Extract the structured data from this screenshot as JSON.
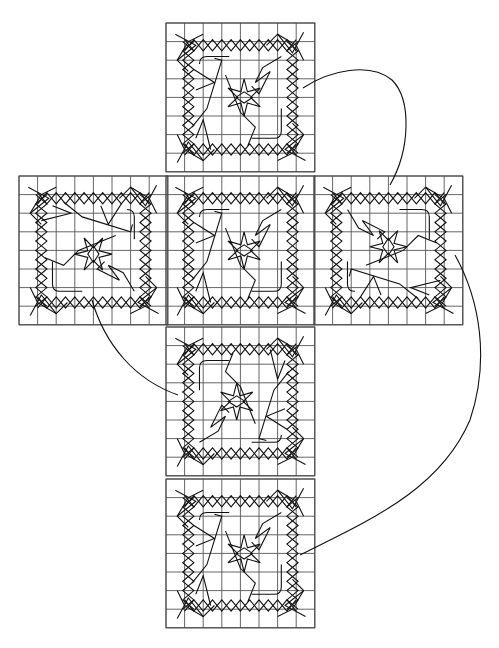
{
  "diagram": {
    "title": "",
    "type": "cube-net-knot-pattern",
    "background": "#ffffff",
    "line_color": "#111111",
    "grid_color": "#555555",
    "grid_cells_per_face": 8,
    "cell_size": 18.6,
    "faces": [
      {
        "id": "top",
        "label": "",
        "x": 166,
        "y": 23,
        "rotation": 0
      },
      {
        "id": "left",
        "label": "",
        "x": 19,
        "y": 176,
        "rotation": 90
      },
      {
        "id": "center",
        "label": "",
        "x": 166,
        "y": 176,
        "rotation": 0
      },
      {
        "id": "right",
        "label": "",
        "x": 314,
        "y": 176,
        "rotation": 270
      },
      {
        "id": "lower",
        "label": "",
        "x": 166,
        "y": 327,
        "rotation": 180
      },
      {
        "id": "bottom",
        "label": "",
        "x": 166,
        "y": 479,
        "rotation": 0
      }
    ],
    "connectors": [
      {
        "id": "top-to-right",
        "path": "M303,88 C330,70 370,62 392,80 C412,100 410,150 390,185"
      },
      {
        "id": "right-to-bottom",
        "path": "M455,255 C480,300 490,360 470,420 C440,490 370,520 300,555"
      },
      {
        "id": "left-to-lower",
        "path": "M92,300 C105,345 135,380 178,395"
      }
    ]
  }
}
